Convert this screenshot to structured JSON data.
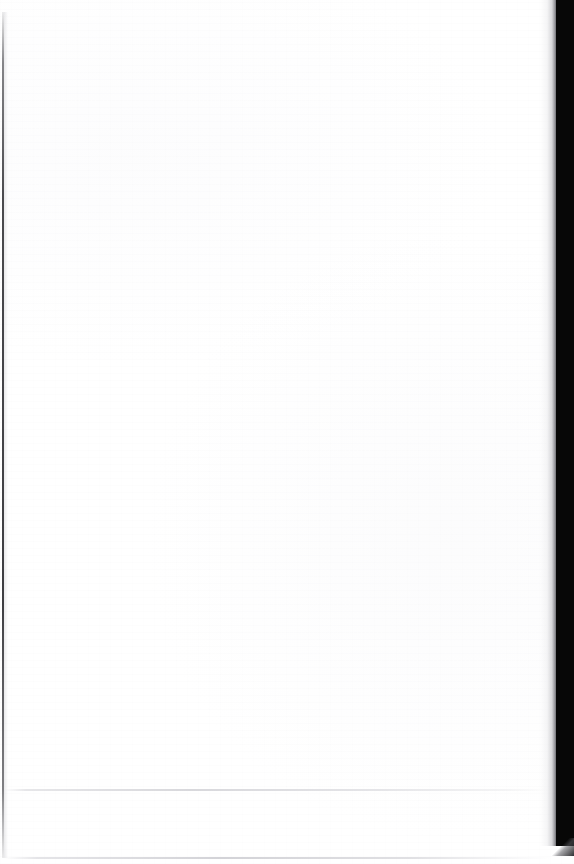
{
  "page": {
    "kind": "scanned-document-page",
    "state": "blank",
    "width_px": 574,
    "height_px": 864,
    "paper_color": "#ffffff",
    "body_text": "",
    "footer_text": ""
  },
  "scan_artifacts": {
    "left_edge": {
      "label": "",
      "color": "#343438",
      "x_px": 2,
      "width_px": 2
    },
    "right_gutter": {
      "label": "",
      "color": "#070707",
      "x_px": 556,
      "width_px": 18,
      "height_px": 846
    },
    "crease_line": {
      "label": "",
      "color": "#d6d6da",
      "y_px": 789
    },
    "bottom_rule": {
      "label": "",
      "color": "#ceced3",
      "y_px": 857
    }
  }
}
